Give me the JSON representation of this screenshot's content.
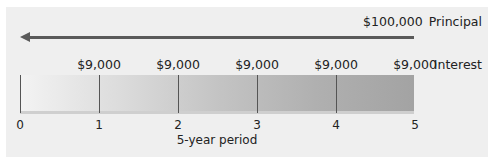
{
  "principal": {
    "amount": "$100,000",
    "label": "Principal"
  },
  "interest": {
    "label": "Interest",
    "payments": [
      "$9,000",
      "$9,000",
      "$9,000",
      "$9,000",
      "$9,000"
    ]
  },
  "timeline": {
    "ticks": [
      "0",
      "1",
      "2",
      "3",
      "4",
      "5"
    ],
    "title": "5-year period"
  },
  "colors": {
    "arrow": "#5a5a5a",
    "bar_start": "#f3f3f3",
    "bar_end": "#a3a3a3",
    "panel": "#efefef"
  }
}
